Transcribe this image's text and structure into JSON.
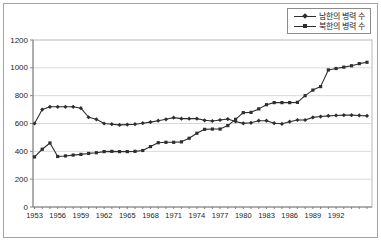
{
  "legend": {
    "items": [
      {
        "label": "남한의 병력 수",
        "marker": "diamond"
      },
      {
        "label": "북한의 병력 수",
        "marker": "square"
      }
    ]
  },
  "colors": {
    "line": "#2e2e2e",
    "gridline": "#d9d9d9",
    "axis": "#808080",
    "plot_border": "#b8b8b8",
    "tick_label": "#262626"
  },
  "chart_data": {
    "type": "line",
    "title": "",
    "xlabel": "",
    "ylabel": "",
    "x": [
      1953,
      1954,
      1955,
      1956,
      1957,
      1958,
      1959,
      1960,
      1961,
      1962,
      1963,
      1964,
      1965,
      1966,
      1967,
      1968,
      1969,
      1970,
      1971,
      1972,
      1973,
      1974,
      1975,
      1976,
      1977,
      1978,
      1979,
      1980,
      1981,
      1982,
      1983,
      1984,
      1985,
      1986,
      1987,
      1988,
      1989,
      1990,
      1991,
      1992,
      1993,
      1994,
      1995,
      1996
    ],
    "series": [
      {
        "name": "남한의 병력 수",
        "marker": "diamond",
        "values": [
          600,
          700,
          720,
          720,
          720,
          720,
          710,
          645,
          630,
          600,
          595,
          590,
          592,
          595,
          602,
          610,
          620,
          630,
          642,
          635,
          635,
          635,
          623,
          618,
          625,
          632,
          615,
          601,
          605,
          620,
          620,
          602,
          598,
          613,
          625,
          625,
          644,
          650,
          655,
          658,
          660,
          660,
          658,
          655
        ]
      },
      {
        "name": "북한의 병력 수",
        "marker": "square",
        "values": [
          360,
          415,
          460,
          363,
          367,
          373,
          378,
          385,
          390,
          398,
          400,
          398,
          398,
          400,
          406,
          434,
          462,
          465,
          465,
          468,
          494,
          530,
          558,
          560,
          560,
          585,
          630,
          678,
          680,
          705,
          735,
          750,
          750,
          750,
          752,
          800,
          840,
          865,
          985,
          995,
          1005,
          1015,
          1030,
          1040
        ]
      }
    ],
    "ylim": [
      0,
      1200
    ],
    "yticks": [
      0,
      200,
      400,
      600,
      800,
      1000,
      1200
    ],
    "xtick_labeled_years": [
      1953,
      1956,
      1959,
      1962,
      1965,
      1968,
      1971,
      1974,
      1977,
      1980,
      1983,
      1986,
      1989,
      1992
    ],
    "grid": true,
    "legend_position": "top-right"
  }
}
